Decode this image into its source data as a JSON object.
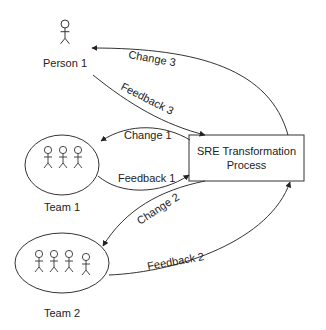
{
  "diagram": {
    "process": {
      "line1": "SRE Transformation",
      "line2": "Process"
    },
    "actors": {
      "person1": "Person 1",
      "team1": "Team 1",
      "team2": "Team 2"
    },
    "edges": {
      "change1": "Change 1",
      "feedback1": "Feedback 1",
      "change2": "Change 2",
      "feedback2": "Feedback 2",
      "change3": "Change 3",
      "feedback3": "Feedback 3"
    },
    "colors": {
      "stroke": "#333333",
      "text": "#222222",
      "background": "#ffffff"
    }
  }
}
